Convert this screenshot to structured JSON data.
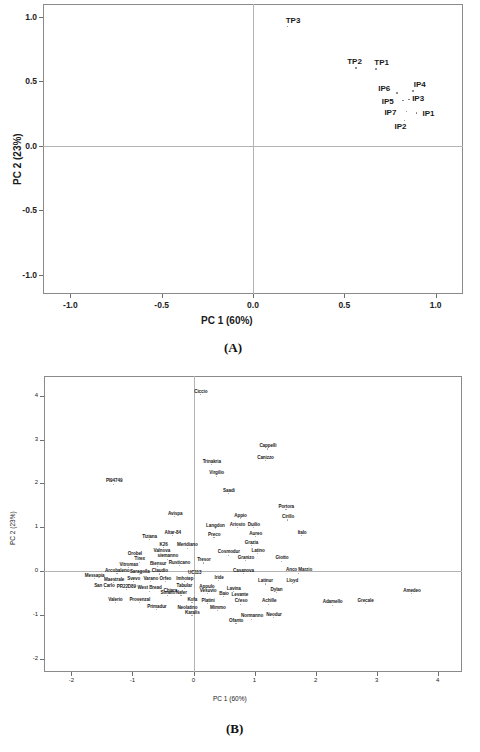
{
  "figure": {
    "panel_a_caption": "(A)",
    "panel_b_caption": "(B)"
  },
  "chart_data": [
    {
      "id": "panel-a",
      "type": "scatter",
      "title": "",
      "xlabel": "PC 1 (60%)",
      "ylabel": "PC 2 (23%)",
      "xlim": [
        -1.15,
        1.15
      ],
      "ylim": [
        -1.15,
        1.1
      ],
      "xticks": [
        "-1.0",
        "-0.5",
        "0.0",
        "0.5",
        "1.0"
      ],
      "xtick_values": [
        -1.0,
        -0.5,
        0.0,
        0.5,
        1.0
      ],
      "yticks": [
        "1.0",
        "0.5",
        "0.0",
        "-0.5",
        "-1.0"
      ],
      "ytick_values": [
        1.0,
        0.5,
        0.0,
        -0.5,
        -1.0
      ],
      "grid": false,
      "zero_lines": true,
      "legend": "none",
      "points": [
        {
          "label": "TP3",
          "x": 0.19,
          "y": 0.925,
          "lx": -2,
          "ly": -11
        },
        {
          "label": "TP2",
          "x": 0.565,
          "y": 0.605,
          "lx": -9,
          "ly": -11
        },
        {
          "label": "TP1",
          "x": 0.675,
          "y": 0.595,
          "lx": -2,
          "ly": -11
        },
        {
          "label": "IP6",
          "x": 0.79,
          "y": 0.41,
          "lx": -19,
          "ly": -9
        },
        {
          "label": "IP4",
          "x": 0.875,
          "y": 0.425,
          "lx": 1,
          "ly": -11
        },
        {
          "label": "IP5",
          "x": 0.82,
          "y": 0.35,
          "lx": -21,
          "ly": -4
        },
        {
          "label": "IP3",
          "x": 0.855,
          "y": 0.36,
          "lx": 3,
          "ly": -5
        },
        {
          "label": "IP7",
          "x": 0.84,
          "y": 0.265,
          "lx": -22,
          "ly": -4
        },
        {
          "label": "IP1",
          "x": 0.895,
          "y": 0.255,
          "lx": 6,
          "ly": -4
        },
        {
          "label": "IP2",
          "x": 0.83,
          "y": 0.195,
          "lx": -10,
          "ly": 1
        }
      ]
    },
    {
      "id": "panel-b",
      "type": "scatter",
      "title": "",
      "xlabel": "PC 1 (60%)",
      "ylabel": "PC 2 (23%)",
      "xlim": [
        -2.45,
        4.4
      ],
      "ylim": [
        -2.3,
        4.45
      ],
      "xticks": [
        "-2",
        "-1",
        "0",
        "1",
        "2",
        "3",
        "4"
      ],
      "xtick_values": [
        -2,
        -1,
        0,
        1,
        2,
        3,
        4
      ],
      "yticks": [
        "4",
        "3",
        "2",
        "1",
        "0",
        "-1",
        "-2"
      ],
      "ytick_values": [
        4,
        3,
        2,
        1,
        0,
        -1,
        -2
      ],
      "grid": false,
      "zero_lines": true,
      "legend": "none",
      "points": [
        {
          "label": "Ciccio",
          "x": 0.12,
          "y": 4.02
        },
        {
          "label": "Cappelli",
          "x": 1.22,
          "y": 2.78
        },
        {
          "label": "Canizzo",
          "x": 1.18,
          "y": 2.52
        },
        {
          "label": "Trinakria",
          "x": 0.3,
          "y": 2.42
        },
        {
          "label": "Virgilio",
          "x": 0.38,
          "y": 2.16
        },
        {
          "label": "PI94749",
          "x": -1.3,
          "y": 1.98
        },
        {
          "label": "Saadi",
          "x": 0.58,
          "y": 1.76
        },
        {
          "label": "Portora",
          "x": 1.52,
          "y": 1.4
        },
        {
          "label": "Avispa",
          "x": -0.3,
          "y": 1.24
        },
        {
          "label": "Appio",
          "x": 0.77,
          "y": 1.2
        },
        {
          "label": "Cirillo",
          "x": 1.55,
          "y": 1.16
        },
        {
          "label": "Langdon",
          "x": 0.36,
          "y": 0.96
        },
        {
          "label": "Ariosto",
          "x": 0.72,
          "y": 0.99
        },
        {
          "label": "Duilio",
          "x": 0.99,
          "y": 0.99
        },
        {
          "label": "Tiziana",
          "x": -0.72,
          "y": 0.72
        },
        {
          "label": "Altar-84",
          "x": -0.34,
          "y": 0.8
        },
        {
          "label": "Preco",
          "x": 0.34,
          "y": 0.76
        },
        {
          "label": "Aureo",
          "x": 1.02,
          "y": 0.78
        },
        {
          "label": "Italo",
          "x": 1.78,
          "y": 0.8
        },
        {
          "label": "K26",
          "x": -0.49,
          "y": 0.53
        },
        {
          "label": "Meridiano",
          "x": -0.1,
          "y": 0.52
        },
        {
          "label": "Grazia",
          "x": 0.95,
          "y": 0.58
        },
        {
          "label": "Orobel",
          "x": -0.96,
          "y": 0.32
        },
        {
          "label": "Valnova",
          "x": -0.52,
          "y": 0.38
        },
        {
          "label": "siemanno",
          "x": -0.42,
          "y": 0.27
        },
        {
          "label": "Cosmodur",
          "x": 0.58,
          "y": 0.36
        },
        {
          "label": "Latino",
          "x": 1.06,
          "y": 0.4
        },
        {
          "label": "Tirex",
          "x": -0.88,
          "y": 0.2
        },
        {
          "label": "Granizo",
          "x": 0.86,
          "y": 0.24
        },
        {
          "label": "Giotto",
          "x": 1.45,
          "y": 0.22
        },
        {
          "label": "Tresor",
          "x": 0.17,
          "y": 0.18
        },
        {
          "label": "Vitromax",
          "x": -1.06,
          "y": 0.08
        },
        {
          "label": "Biensur",
          "x": -0.58,
          "y": 0.09
        },
        {
          "label": "Rusticano",
          "x": -0.23,
          "y": 0.12
        },
        {
          "label": "Arcobaleno",
          "x": -1.25,
          "y": -0.06
        },
        {
          "label": "Saragolla",
          "x": -0.88,
          "y": -0.09
        },
        {
          "label": "Claudio",
          "x": -0.55,
          "y": -0.07
        },
        {
          "label": "UC113",
          "x": 0.02,
          "y": -0.1
        },
        {
          "label": "Casanova",
          "x": 0.82,
          "y": -0.06
        },
        {
          "label": "Anco Marzio",
          "x": 1.73,
          "y": -0.05
        },
        {
          "label": "Messapia",
          "x": -1.62,
          "y": -0.18
        },
        {
          "label": "Maestrale",
          "x": -1.3,
          "y": -0.26
        },
        {
          "label": "Svevo",
          "x": -0.98,
          "y": -0.25
        },
        {
          "label": "Varano",
          "x": -0.7,
          "y": -0.24
        },
        {
          "label": "Orfeo",
          "x": -0.46,
          "y": -0.24
        },
        {
          "label": "Imhotep",
          "x": -0.14,
          "y": -0.24
        },
        {
          "label": "Iride",
          "x": 0.42,
          "y": -0.22
        },
        {
          "label": "Latinur",
          "x": 1.18,
          "y": -0.3
        },
        {
          "label": "Lloyd",
          "x": 1.62,
          "y": -0.29
        },
        {
          "label": "San Carlo",
          "x": -1.46,
          "y": -0.4
        },
        {
          "label": "PR22D89",
          "x": -1.1,
          "y": -0.43
        },
        {
          "label": "Tabular",
          "x": -0.15,
          "y": -0.4
        },
        {
          "label": "Appulo",
          "x": 0.22,
          "y": -0.42
        },
        {
          "label": "West Bread",
          "x": -0.72,
          "y": -0.46
        },
        {
          "label": "Chiara",
          "x": -0.38,
          "y": -0.52
        },
        {
          "label": "Vesuvio",
          "x": 0.24,
          "y": -0.52
        },
        {
          "label": "Lavina",
          "x": 0.66,
          "y": -0.48
        },
        {
          "label": "Dylan",
          "x": 1.36,
          "y": -0.5
        },
        {
          "label": "Simeto",
          "x": -0.42,
          "y": -0.57
        },
        {
          "label": "Nafer",
          "x": -0.2,
          "y": -0.57
        },
        {
          "label": "Baio",
          "x": 0.5,
          "y": -0.58
        },
        {
          "label": "Levante",
          "x": 0.76,
          "y": -0.62
        },
        {
          "label": "Valerio",
          "x": -1.28,
          "y": -0.72
        },
        {
          "label": "Provenzal",
          "x": -0.88,
          "y": -0.72
        },
        {
          "label": "Kofa",
          "x": -0.02,
          "y": -0.72
        },
        {
          "label": "Platini",
          "x": 0.24,
          "y": -0.74
        },
        {
          "label": "Creso",
          "x": 0.78,
          "y": -0.76
        },
        {
          "label": "Achille",
          "x": 1.24,
          "y": -0.76
        },
        {
          "label": "Adamello",
          "x": 2.28,
          "y": -0.78
        },
        {
          "label": "Grecale",
          "x": 2.82,
          "y": -0.74
        },
        {
          "label": "Amedeo",
          "x": 3.58,
          "y": -0.52
        },
        {
          "label": "Primadur",
          "x": -0.6,
          "y": -0.88
        },
        {
          "label": "Neolatino",
          "x": -0.1,
          "y": -0.92
        },
        {
          "label": "Mimmo",
          "x": 0.4,
          "y": -0.9
        },
        {
          "label": "Karalis",
          "x": -0.02,
          "y": -1.02
        },
        {
          "label": "Normanno",
          "x": 0.96,
          "y": -1.1
        },
        {
          "label": "Neodur",
          "x": 1.32,
          "y": -1.06
        },
        {
          "label": "Ofanto",
          "x": 0.7,
          "y": -1.2
        }
      ]
    }
  ]
}
